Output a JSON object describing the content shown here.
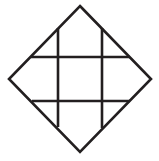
{
  "figure": {
    "canvas": {
      "width": 159,
      "height": 161,
      "background": "#ffffff"
    },
    "style": {
      "stroke_color": "#231f20",
      "stroke_width": 2.6,
      "fill": "none"
    },
    "diamond": {
      "name": "outer-diamond",
      "vertices": [
        {
          "label": "top",
          "x": 80,
          "y": 6
        },
        {
          "label": "right",
          "x": 151,
          "y": 79
        },
        {
          "label": "bottom",
          "x": 80,
          "y": 152
        },
        {
          "label": "left",
          "x": 9,
          "y": 79
        }
      ]
    },
    "grid_lines": [
      {
        "name": "vertical-line-left",
        "orientation": "vertical",
        "x": 58,
        "y1": 28,
        "y2": 127
      },
      {
        "name": "vertical-line-right",
        "orientation": "vertical",
        "x": 102,
        "y1": 28,
        "y2": 128
      },
      {
        "name": "horizontal-line-top",
        "orientation": "horizontal",
        "y": 57,
        "x1": 31,
        "x2": 130
      },
      {
        "name": "horizontal-line-bottom",
        "orientation": "horizontal",
        "y": 101,
        "x1": 32,
        "x2": 130
      }
    ],
    "counts": {
      "vertical_lines": 2,
      "horizontal_lines": 2,
      "diamond_edges": 4,
      "interior_cells": 9
    }
  }
}
